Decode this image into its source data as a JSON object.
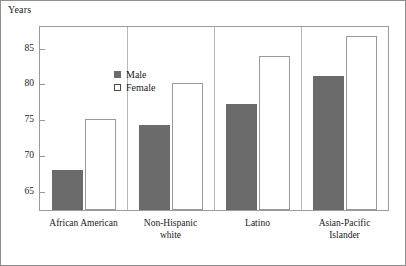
{
  "figure": {
    "y_axis_title": "Years"
  },
  "legend": {
    "position": "inside-top-left",
    "entries": [
      {
        "label": "Male",
        "swatch": "filled-gray-square",
        "color": "#6b6b6b"
      },
      {
        "label": "Female",
        "swatch": "open-white-square",
        "color": "#ffffff"
      }
    ]
  },
  "chart_data": {
    "type": "bar",
    "title": "",
    "xlabel": "",
    "ylabel": "Years",
    "ylim": [
      62.5,
      88.0
    ],
    "yticks": [
      65,
      70,
      75,
      80,
      85
    ],
    "ytick_labels": [
      "65",
      "70",
      "75",
      "80",
      "85"
    ],
    "grid": false,
    "legend_position": "inside-top-left",
    "categories": [
      "African American",
      "Non-Hispanic\nwhite",
      "Latino",
      "Asian-Pacific\nIslander"
    ],
    "series": [
      {
        "name": "Male",
        "color": "#6b6b6b",
        "values": [
          68.1,
          74.3,
          77.3,
          81.2
        ]
      },
      {
        "name": "Female",
        "color": "#ffffff",
        "values": [
          75.2,
          80.2,
          83.9,
          86.8
        ]
      }
    ]
  }
}
